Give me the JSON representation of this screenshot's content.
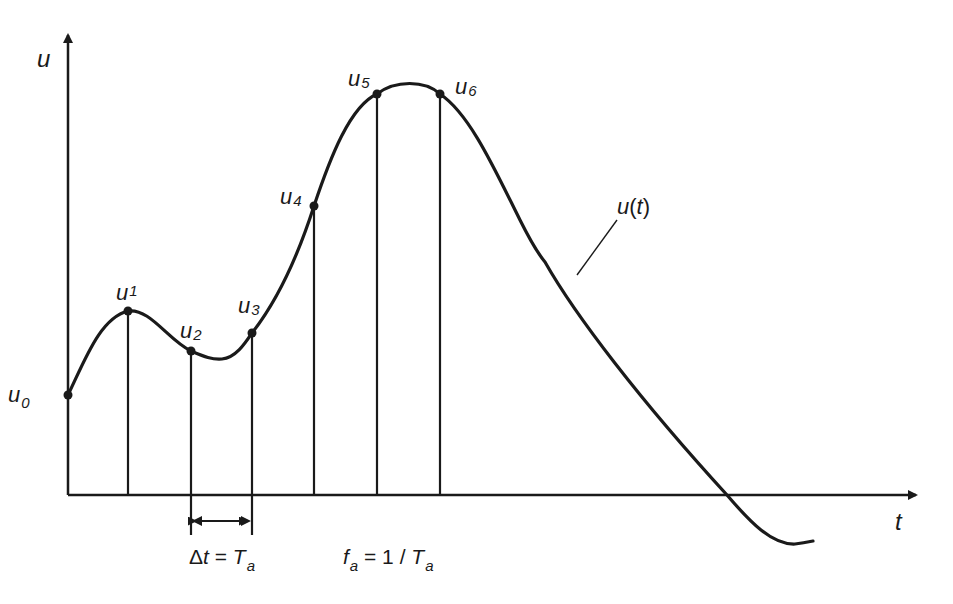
{
  "figure": {
    "axis_labels": {
      "y": "u",
      "x": "t"
    },
    "curve_label": {
      "base": "u",
      "paren_open": "(",
      "var": "t",
      "paren_close": ")"
    },
    "samples": [
      {
        "base": "u",
        "index": "0"
      },
      {
        "base": "u",
        "index": "1"
      },
      {
        "base": "u",
        "index": "2"
      },
      {
        "base": "u",
        "index": "3"
      },
      {
        "base": "u",
        "index": "4"
      },
      {
        "base": "u",
        "index": "5"
      },
      {
        "base": "u",
        "index": "6"
      }
    ],
    "interval_formula": {
      "delta": "Δ",
      "var": "t",
      "eq": " = ",
      "rhs": "T",
      "rhs_sub": "a"
    },
    "frequency_formula": {
      "lhs": "f",
      "lhs_sub": "a",
      "eq": " = 1 / ",
      "rhs": "T",
      "rhs_sub": "a"
    }
  },
  "colors": {
    "stroke": "#1a1a1a",
    "background": "#ffffff"
  }
}
